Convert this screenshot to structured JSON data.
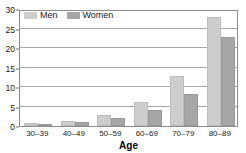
{
  "chart_data": {
    "type": "bar",
    "title": "",
    "subtitle": "",
    "xlabel": "Age",
    "ylabel": "",
    "categories": [
      "30–39",
      "40–49",
      "50–59",
      "60–69",
      "70–79",
      "80–89"
    ],
    "series": [
      {
        "name": "Men",
        "color": "#cdcdcd",
        "values": [
          0.8,
          1.3,
          2.9,
          6.2,
          12.7,
          28.0
        ]
      },
      {
        "name": "Women",
        "color": "#a6a6a6",
        "values": [
          0.15,
          1.0,
          2.0,
          4.2,
          8.3,
          22.8
        ]
      }
    ],
    "ylim": [
      0,
      30
    ],
    "yticks": [
      0,
      5,
      10,
      15,
      20,
      25,
      30
    ],
    "ytick_labels": [
      "0",
      "5",
      "10",
      "15",
      "20",
      "25",
      "30"
    ],
    "grid": true,
    "grid_axis": "y",
    "legend_position": "top-left",
    "legend_entries": [
      "Men",
      "Women"
    ],
    "annotations": []
  },
  "legend": {
    "men_label": "Men",
    "women_label": "Women"
  },
  "axes": {
    "x_title": "Age"
  }
}
